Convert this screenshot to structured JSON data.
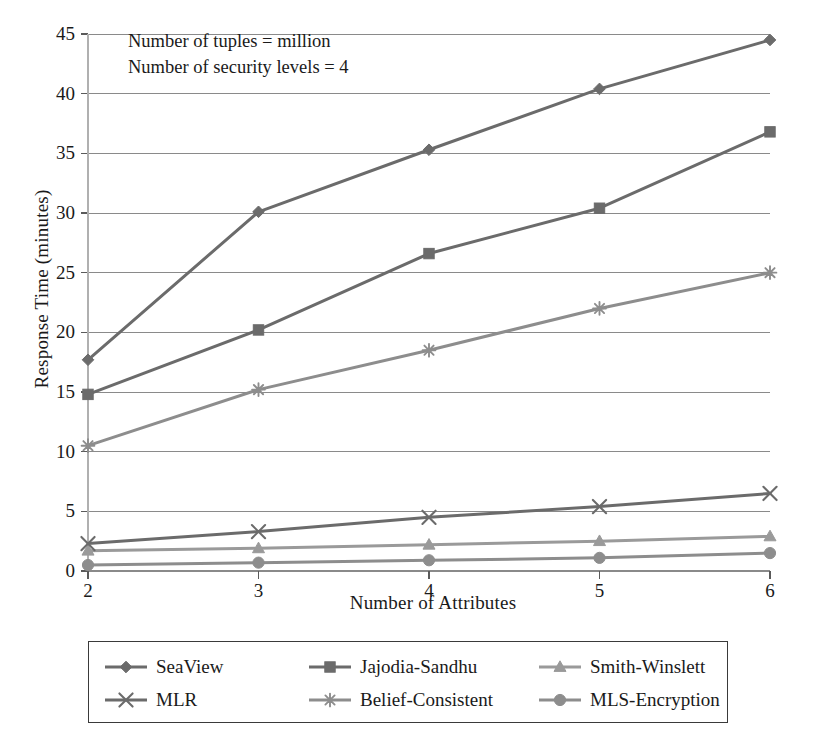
{
  "chart_data": {
    "type": "line",
    "title": "",
    "xlabel": "Number of Attributes",
    "ylabel": "Response Time (minutes)",
    "x": [
      2,
      3,
      4,
      5,
      6
    ],
    "xticklabels": [
      "2",
      "3",
      "4",
      "5",
      "6"
    ],
    "yticklabels": [
      "0",
      "5",
      "10",
      "15",
      "20",
      "25",
      "30",
      "35",
      "40",
      "45"
    ],
    "xlim": [
      2,
      6
    ],
    "ylim": [
      0,
      45
    ],
    "grid": "horizontal",
    "legend_position": "below-plot",
    "annotations": [
      "Number of tuples = million",
      "Number of security levels = 4"
    ],
    "series": [
      {
        "name": "SeaView",
        "marker": "diamond",
        "color": "#6b6b6b",
        "values": [
          17.7,
          30.1,
          35.3,
          40.4,
          44.5
        ]
      },
      {
        "name": "Jajodia-Sandhu",
        "marker": "square",
        "color": "#6b6b6b",
        "values": [
          14.8,
          20.2,
          26.6,
          30.4,
          36.8
        ]
      },
      {
        "name": "Smith-Winslett",
        "marker": "triangle",
        "color": "#9a9a9a",
        "values": [
          1.7,
          1.9,
          2.2,
          2.5,
          2.9
        ]
      },
      {
        "name": "MLR",
        "marker": "x-cross",
        "color": "#6b6b6b",
        "values": [
          2.3,
          3.3,
          4.5,
          5.4,
          6.5
        ]
      },
      {
        "name": "Belief-Consistent",
        "marker": "asterisk",
        "color": "#8d8d8d",
        "values": [
          10.5,
          15.2,
          18.5,
          22.0,
          25.0
        ]
      },
      {
        "name": "MLS-Encryption",
        "marker": "circle",
        "color": "#8d8d8d",
        "values": [
          0.5,
          0.7,
          0.9,
          1.1,
          1.5
        ]
      }
    ]
  },
  "axes": {
    "y_title": "Response Time (minutes)",
    "x_title": "Number of Attributes",
    "y_ticks": [
      "45",
      "40",
      "35",
      "30",
      "25",
      "20",
      "15",
      "10",
      "5",
      "0"
    ],
    "x_ticks": [
      "2",
      "3",
      "4",
      "5",
      "6"
    ]
  },
  "annotation": {
    "line1": "Number of tuples = million",
    "line2": "Number of security levels = 4"
  },
  "legend": {
    "items": [
      {
        "label": "SeaView",
        "marker": "diamond",
        "color": "#6b6b6b"
      },
      {
        "label": "Jajodia-Sandhu",
        "marker": "square",
        "color": "#6b6b6b"
      },
      {
        "label": "Smith-Winslett",
        "marker": "triangle",
        "color": "#9a9a9a"
      },
      {
        "label": "MLR",
        "marker": "x-cross",
        "color": "#6b6b6b"
      },
      {
        "label": "Belief-Consistent",
        "marker": "asterisk",
        "color": "#8d8d8d"
      },
      {
        "label": "MLS-Encryption",
        "marker": "circle",
        "color": "#8d8d8d"
      }
    ]
  },
  "colors": {
    "axis": "#5a5a5a",
    "grid": "#8a8a8a",
    "text": "#1a1a1a",
    "background": "#ffffff"
  }
}
